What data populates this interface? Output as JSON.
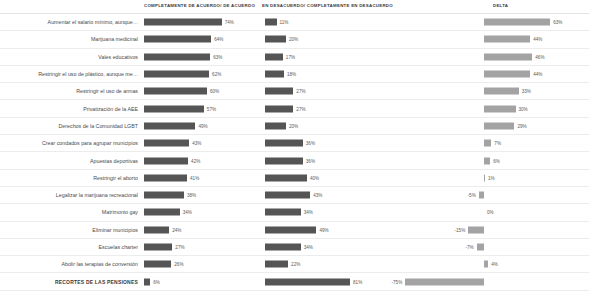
{
  "header": {
    "columns": [
      "COMPLETAMENTE DE ACUERDO/ DE ACUERDO",
      "EN DESACUERDO/ COMPLETAMENTE EN DESACUERDO",
      "DELTA"
    ]
  },
  "colors": {
    "bar_dark": "#555555",
    "bar_light": "#a3a3a3",
    "grid": "#ececec",
    "text": "#4a4a4a"
  },
  "chart_data": {
    "type": "bar",
    "title": "",
    "xlabel": "",
    "ylabel": "",
    "grid": false,
    "legend_position": "none",
    "categories": [
      "Aumentar el salario mínimo, aunque…",
      "Marijuana medicinal",
      "Vales educativos",
      "Restringir el uso de plástico, aunque me…",
      "Restringir el uso de armas",
      "Privatización de la AEE",
      "Derechos de la Comunidad LGBT",
      "Crear condados para agrupar municipios",
      "Apuestas deportivas",
      "Restringir el aborto",
      "Legalizar la marijuana recreacional",
      "Matrimonio gay",
      "Eliminar municipios",
      "Escuelas charter",
      "Abolir las terapias de conversión",
      "RECORTES DE LAS PENSIONES"
    ],
    "series": [
      {
        "name": "COMPLETAMENTE DE ACUERDO/ DE ACUERDO",
        "values": [
          74,
          64,
          63,
          62,
          60,
          57,
          49,
          43,
          42,
          41,
          38,
          34,
          24,
          27,
          26,
          6
        ],
        "labels": [
          "74%",
          "64%",
          "63%",
          "62%",
          "60%",
          "57%",
          "49%",
          "43%",
          "42%",
          "41%",
          "38%",
          "34%",
          "24%",
          "27%",
          "26%",
          "6%"
        ]
      },
      {
        "name": "EN DESACUERDO/ COMPLETAMENTE EN DESACUERDO",
        "values": [
          11,
          20,
          17,
          18,
          27,
          27,
          20,
          36,
          36,
          40,
          43,
          34,
          49,
          34,
          22,
          81
        ],
        "labels": [
          "11%",
          "20%",
          "17%",
          "18%",
          "27%",
          "27%",
          "20%",
          "36%",
          "36%",
          "40%",
          "43%",
          "34%",
          "49%",
          "34%",
          "22%",
          "81%"
        ]
      },
      {
        "name": "DELTA",
        "values": [
          63,
          44,
          46,
          44,
          33,
          30,
          29,
          7,
          6,
          1,
          -5,
          0,
          -15,
          -7,
          4,
          -75
        ],
        "labels": [
          "63%",
          "44%",
          "46%",
          "44%",
          "33%",
          "30%",
          "29%",
          "7%",
          "6%",
          "1%",
          "-5%",
          "0%",
          "-15%",
          "-7%",
          "4%",
          "-75%"
        ]
      }
    ]
  }
}
